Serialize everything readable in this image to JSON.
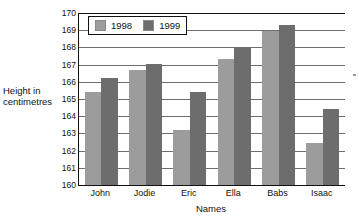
{
  "chart_data": {
    "type": "bar",
    "title": "",
    "xlabel": "Names",
    "ylabel": "Height in centimetres",
    "ylabel_line1": "Height in",
    "ylabel_line2": "centimetres",
    "categories": [
      "John",
      "Jodie",
      "Eric",
      "Ella",
      "Babs",
      "Isaac"
    ],
    "series": [
      {
        "name": "1998",
        "color": "#9c9c9c",
        "values": [
          165.4,
          166.7,
          163.2,
          167.35,
          168.95,
          162.45
        ]
      },
      {
        "name": "1999",
        "color": "#6d6d6d",
        "values": [
          166.2,
          167.05,
          165.4,
          168.0,
          169.3,
          164.4
        ]
      }
    ],
    "ylim": [
      160,
      170
    ],
    "ytick_step": 1,
    "yticks": [
      160,
      161,
      162,
      163,
      164,
      165,
      166,
      167,
      168,
      169,
      170
    ],
    "ytick_labels": [
      "160",
      "161",
      "162",
      "163",
      "164",
      "165",
      "166",
      "167",
      "168",
      "169",
      "170"
    ],
    "grid": true,
    "grid_axis": "y",
    "legend_position": "top-left-inside"
  },
  "legend": {
    "entries": [
      {
        "label": "1998",
        "swatch": "series-1998-swatch"
      },
      {
        "label": "1999",
        "swatch": "series-1999-swatch"
      }
    ]
  },
  "colors": {
    "series_1998": "#9c9c9c",
    "series_1999": "#6d6d6d",
    "axis": "#111111",
    "gridline": "#6f6f6f",
    "background": "#ffffff"
  }
}
